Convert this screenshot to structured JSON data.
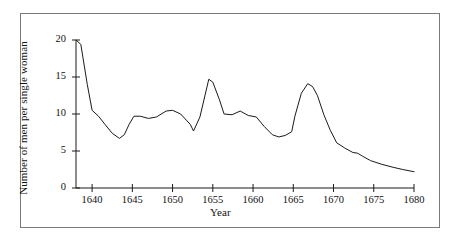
{
  "figure": {
    "border_color": "#7b7b7b",
    "background": "#ffffff",
    "line_color": "#1a1a1a"
  },
  "chart_data": {
    "type": "line",
    "title": "",
    "xlabel": "Year",
    "ylabel": "Number of men per single woman",
    "xlim": [
      1638,
      1680
    ],
    "ylim": [
      0,
      20
    ],
    "xticks": [
      1640,
      1645,
      1650,
      1655,
      1660,
      1665,
      1670,
      1675,
      1680
    ],
    "xticklabels": [
      "1640",
      "1645",
      "1650",
      "1655",
      "1660",
      "1665",
      "1670",
      "1675",
      "1680"
    ],
    "yticks": [
      0,
      5,
      10,
      15,
      20
    ],
    "yticklabels": [
      "0",
      "5",
      "10",
      "15",
      "20"
    ],
    "grid": false,
    "legend": false,
    "series": [
      {
        "name": "Sex ratio",
        "x": [
          1638.0,
          1638.6,
          1639.4,
          1640.0,
          1640.8,
          1641.6,
          1642.5,
          1643.4,
          1644.0,
          1644.6,
          1645.2,
          1646.0,
          1647.0,
          1648.0,
          1649.2,
          1650.0,
          1651.0,
          1652.2,
          1652.6,
          1653.4,
          1654.5,
          1655.0,
          1655.8,
          1656.4,
          1657.4,
          1658.4,
          1659.4,
          1660.4,
          1661.4,
          1662.4,
          1663.2,
          1664.0,
          1664.8,
          1665.2,
          1666.0,
          1666.8,
          1667.4,
          1668.0,
          1668.8,
          1669.6,
          1670.4,
          1671.4,
          1672.4,
          1673.0,
          1673.6,
          1674.6,
          1676.0,
          1677.4,
          1678.6,
          1680.0
        ],
        "y": [
          20.0,
          19.4,
          14.0,
          10.5,
          9.7,
          8.6,
          7.4,
          6.7,
          7.2,
          8.6,
          9.7,
          9.7,
          9.4,
          9.6,
          10.4,
          10.5,
          10.0,
          8.6,
          7.7,
          9.6,
          14.7,
          14.3,
          12.0,
          10.0,
          9.9,
          10.4,
          9.8,
          9.6,
          8.3,
          7.2,
          6.9,
          7.1,
          7.6,
          9.7,
          12.8,
          14.1,
          13.7,
          12.5,
          9.9,
          7.8,
          6.1,
          5.4,
          4.8,
          4.7,
          4.3,
          3.7,
          3.2,
          2.8,
          2.5,
          2.2
        ]
      }
    ]
  },
  "axes_geometry": {
    "x_pixel_min": 76,
    "x_pixel_max": 414,
    "y_pixel_min": 188,
    "y_pixel_max": 40
  }
}
